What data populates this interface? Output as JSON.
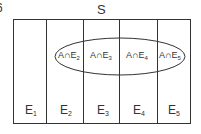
{
  "figure": {
    "corner_label": "6",
    "sample_space_label": "S",
    "event_set": "A",
    "colors": {
      "stroke": "#333333",
      "background": "#ffffff",
      "text": "#333333"
    }
  },
  "partitions": [
    {
      "name": "E",
      "sub": "1",
      "cx": 30
    },
    {
      "name": "E",
      "sub": "2",
      "cx": 66
    },
    {
      "name": "E",
      "sub": "3",
      "cx": 102
    },
    {
      "name": "E",
      "sub": "4",
      "cx": 138
    },
    {
      "name": "E",
      "sub": "5",
      "cx": 174
    }
  ],
  "intersections": [
    {
      "prefix": "A∩E",
      "sub": "2",
      "cx": 69
    },
    {
      "prefix": "A∩E",
      "sub": "3",
      "cx": 101
    },
    {
      "prefix": "A∩E",
      "sub": "4",
      "cx": 137
    },
    {
      "prefix": "A∩E",
      "sub": "5",
      "cx": 170
    }
  ]
}
